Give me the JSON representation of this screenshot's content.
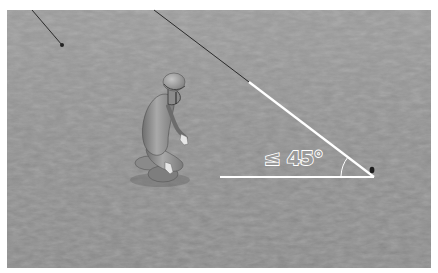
{
  "scene": {
    "description": "Grayscale 3D render of a kneeling figure in a helmet on rough terrain with an angle annotation",
    "annotation": {
      "comparator": "≤",
      "angle_value": "45°",
      "label": "≤ 45°"
    },
    "colors": {
      "ground_base": "#8a8a8a",
      "ground_dark": "#6e6e6e",
      "ground_light": "#a4a4a4",
      "annotation_line": "#ffffff",
      "guide_line": "#2a2a2a",
      "figure": "#9a9a9a",
      "border": "#ffffff"
    }
  }
}
